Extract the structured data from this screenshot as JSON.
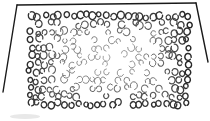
{
  "sketch": {
    "description": "Hand-drawn rectangle filled with small circles, denser and darker near edges, faint and sparse in center",
    "frame": {
      "color": "#1a1a1a",
      "top_edge": [
        [
          17,
          5
        ],
        [
          196,
          3
        ]
      ],
      "left_edge": [
        [
          17,
          5
        ],
        [
          3,
          92
        ]
      ],
      "right_edge": [
        [
          196,
          3
        ],
        [
          208,
          62
        ]
      ]
    },
    "circle_field": {
      "bounds": {
        "x0": 26,
        "y0": 12,
        "x1": 190,
        "y1": 108
      },
      "edge_color": "#222222",
      "center_color": "#8a8a8a",
      "columns": 24,
      "rows": 12,
      "radius_min": 2.2,
      "radius_max": 3.6
    },
    "smudge": {
      "x": 10,
      "y": 114,
      "width": 30,
      "height": 5
    }
  }
}
